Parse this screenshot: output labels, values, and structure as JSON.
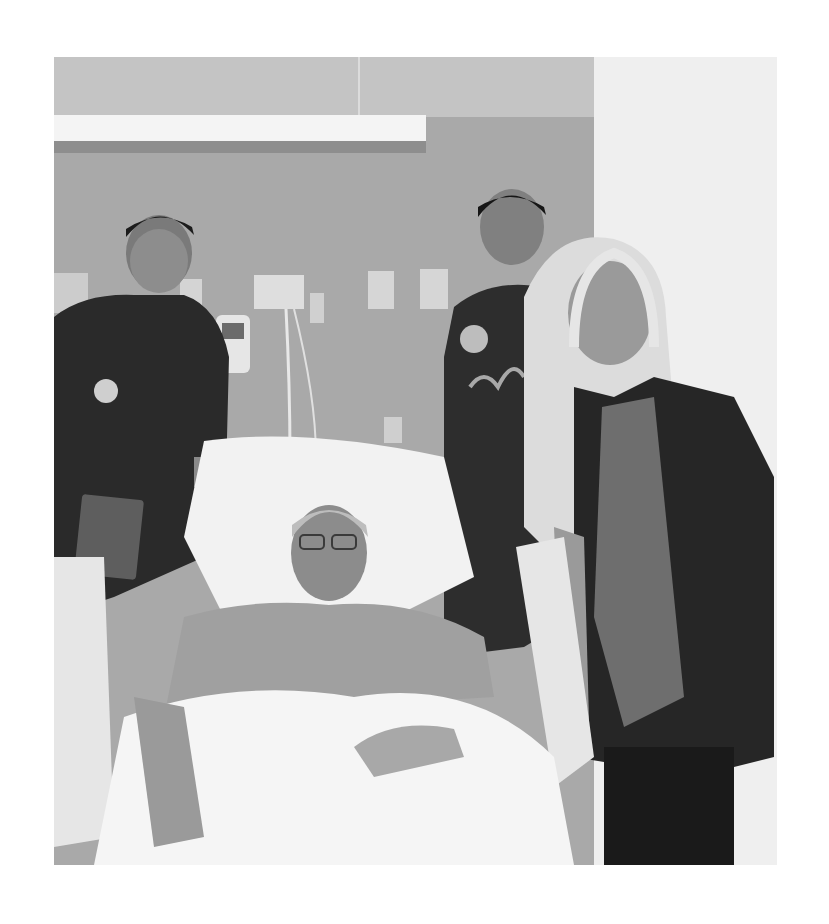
{
  "image": {
    "type": "photograph",
    "color_mode": "grayscale",
    "description": "Four people in a hospital room: an older man lying in a hospital bed with an IV, two young men and a young woman standing around the bed smiling",
    "subjects": [
      {
        "role": "patient",
        "description": "older man with glasses lying in hospital bed under white blanket, hospital gown, IV in arm"
      },
      {
        "role": "visitor-left",
        "description": "young man in dark hoodie holding a tablet/folder"
      },
      {
        "role": "visitor-center",
        "description": "young man in dark sweatshirt with script logo"
      },
      {
        "role": "visitor-right",
        "description": "young woman with long wavy blonde hair, dark cardigan over tank top"
      }
    ],
    "scene_elements": [
      "overhead light fixture",
      "wall medical outlets",
      "wall-mounted monitor",
      "hospital bed rails",
      "pillows",
      "white wall at right"
    ]
  }
}
